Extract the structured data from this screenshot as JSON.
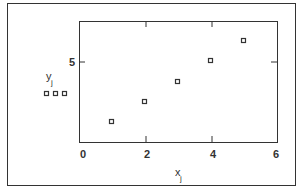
{
  "chart_data": {
    "type": "scatter",
    "title": "",
    "xlabel": "x",
    "xlabel_sub": "j",
    "ylabel": "y",
    "ylabel_sub": "j",
    "x": [
      1,
      2,
      3,
      4,
      5
    ],
    "y": [
      2,
      3,
      4,
      5,
      6
    ],
    "xlim": [
      0,
      6
    ],
    "ylim": [
      1,
      7
    ],
    "xticks": [
      "0",
      "2",
      "4",
      "6"
    ],
    "yticks": [
      "5"
    ],
    "grid": false,
    "marker": "open-square",
    "legend_marker": "three open squares under y label"
  }
}
